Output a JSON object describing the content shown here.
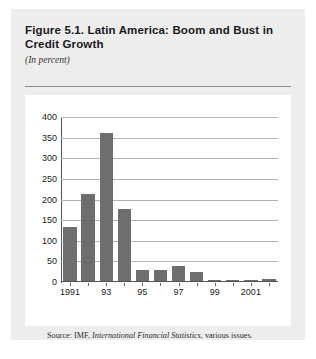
{
  "figure": {
    "title": "Figure 5.1. Latin America: Boom and Bust in Credit Growth",
    "subtitle": "(In percent)",
    "source_prefix": "Source: IMF, ",
    "source_italic": "International Financial Statistics",
    "source_suffix": ", various issues."
  },
  "colors": {
    "bar": "#6e6e6e",
    "panel": "#ededed",
    "plot_background": "#ffffff",
    "gridline": "#b3b3b3",
    "axis": "#555555",
    "rule": "#8c8c8c"
  },
  "chart_data": {
    "type": "bar",
    "title": "Figure 5.1. Latin America: Boom and Bust in Credit Growth",
    "subtitle": "(In percent)",
    "xlabel": "",
    "ylabel": "",
    "ylim": [
      0,
      400
    ],
    "ytick_values": [
      0,
      50,
      100,
      150,
      200,
      250,
      300,
      350,
      400
    ],
    "ytick_labels": [
      "0",
      "50",
      "100",
      "150",
      "200",
      "250",
      "300",
      "350",
      "400"
    ],
    "grid": true,
    "legend": "none",
    "categories": [
      "1991",
      "1992",
      "1993",
      "1994",
      "1995",
      "1996",
      "1997",
      "1998",
      "1999",
      "2000",
      "2001",
      "2002"
    ],
    "xtick_labels": [
      "1991",
      "93",
      "95",
      "97",
      "99",
      "2001"
    ],
    "xtick_categories": [
      "1991",
      "1993",
      "1995",
      "1997",
      "1999",
      "2001"
    ],
    "values": [
      130,
      210,
      360,
      175,
      27,
      26,
      37,
      21,
      1,
      3,
      3,
      4
    ],
    "series": [
      {
        "name": "Credit growth",
        "values": [
          130,
          210,
          360,
          175,
          27,
          26,
          37,
          21,
          1,
          3,
          3,
          4
        ]
      }
    ]
  }
}
